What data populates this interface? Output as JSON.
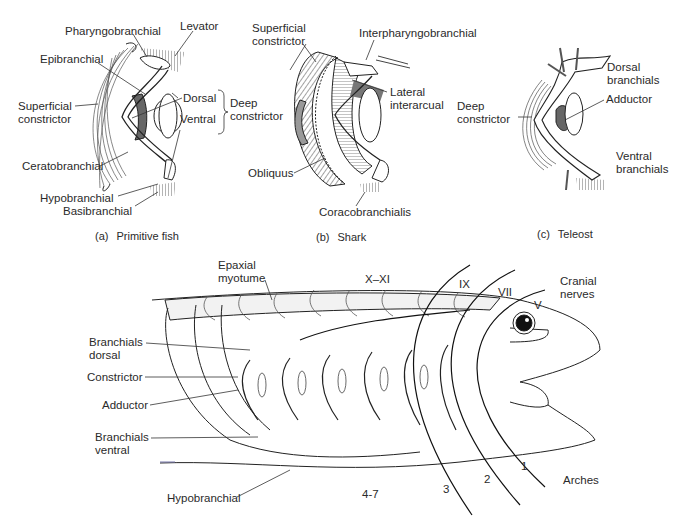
{
  "panels": [
    {
      "id": "a",
      "caption_tag": "(a)",
      "caption": "Primitive fish",
      "labels": {
        "pharyngobranchial": "Pharyngobranchial",
        "levator": "Levator",
        "epibranchial": "Epibranchial",
        "superficial_constrictor": [
          "Superficial",
          "constrictor"
        ],
        "dorsal": "Dorsal",
        "ventral": "Ventral",
        "deep_constrictor": [
          "Deep",
          "constrictor"
        ],
        "ceratobranchial": "Ceratobranchial",
        "hypobranchial": "Hypobranchial",
        "basibranchial": "Basibranchial"
      }
    },
    {
      "id": "b",
      "caption_tag": "(b)",
      "caption": "Shark",
      "labels": {
        "superficial_constrictor": [
          "Superficial",
          "constrictor"
        ],
        "interpharyngobranchial": "Interpharyngobranchial",
        "lateral_interarcual": [
          "Lateral",
          "interarcual"
        ],
        "obliquus": "Obliquus",
        "coracobranchialis": "Coracobranchialis"
      }
    },
    {
      "id": "c",
      "caption_tag": "(c)",
      "caption": "Teleost",
      "labels": {
        "dorsal_branchials": [
          "Dorsal",
          "branchials"
        ],
        "deep_constrictor": [
          "Deep",
          "constrictor"
        ],
        "adductor": "Adductor",
        "ventral_branchials": [
          "Ventral",
          "branchials"
        ]
      }
    }
  ],
  "bottom": {
    "labels": {
      "epaxial_myotume": [
        "Epaxial",
        "myotume"
      ],
      "branchials_dorsal": [
        "Branchials",
        "dorsal"
      ],
      "constrictor": "Constrictor",
      "adductor": "Adductor",
      "branchials_ventral": [
        "Branchials",
        "ventral"
      ],
      "hypobranchial": "Hypobranchial",
      "cranial_nerves": [
        "Cranial",
        "nerves"
      ],
      "arches": "Arches"
    },
    "nerves": [
      "X–XI",
      "IX",
      "VII",
      "V"
    ],
    "arches": [
      "1",
      "2",
      "3",
      "4-7"
    ]
  }
}
